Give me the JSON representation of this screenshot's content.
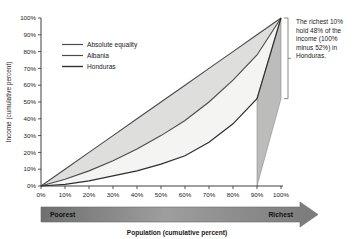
{
  "chart_data": {
    "type": "line",
    "title": "",
    "xlabel": "Population (cumulative percent)",
    "ylabel": "Income (cumulative percent)",
    "xlim": [
      0,
      100
    ],
    "ylim": [
      0,
      100
    ],
    "grid": false,
    "legend_position": "upper-left-inside",
    "x": [
      0,
      10,
      20,
      30,
      40,
      50,
      60,
      70,
      80,
      90,
      100
    ],
    "xticklabels": [
      "0%",
      "10%",
      "20%",
      "30%",
      "40%",
      "50%",
      "60%",
      "70%",
      "80%",
      "90%",
      "100%"
    ],
    "yticklabels": [
      "0%",
      "10%",
      "20%",
      "30%",
      "40%",
      "50%",
      "60%",
      "70%",
      "80%",
      "90%",
      "100%"
    ],
    "series": [
      {
        "name": "Absolute equality",
        "color": "#4d4d4d",
        "values": [
          0,
          10,
          20,
          30,
          40,
          50,
          60,
          70,
          80,
          90,
          100
        ]
      },
      {
        "name": "Albania",
        "color": "#4d4d4d",
        "values": [
          0,
          4,
          9,
          15,
          22,
          30,
          39,
          50,
          63,
          78,
          100
        ]
      },
      {
        "name": "Honduras",
        "color": "#333333",
        "values": [
          0,
          1,
          3,
          6,
          9,
          13,
          18,
          26,
          37,
          52,
          100
        ]
      }
    ],
    "fills": [
      {
        "name": "equality-to-albania-band",
        "color": "#dedede"
      },
      {
        "name": "albania-to-honduras-band",
        "color": "#f2f2f2"
      },
      {
        "name": "richest-decile-band",
        "color": "#b8b8b8"
      }
    ],
    "annotation": {
      "text": "The richest 10% hold 48% of the income (100% minus 52%) in Honduras.",
      "bracket_from_percent": 100,
      "bracket_to_percent": 52
    }
  },
  "legend": {
    "items": [
      {
        "label": "Absolute equality"
      },
      {
        "label": "Albania"
      },
      {
        "label": "Honduras"
      }
    ]
  },
  "axis": {
    "y_title": "Income (cumulative percent)",
    "x_title": "Population (cumulative percent)"
  },
  "gradient_bar": {
    "left_label": "Poorest",
    "right_label": "Richest"
  }
}
